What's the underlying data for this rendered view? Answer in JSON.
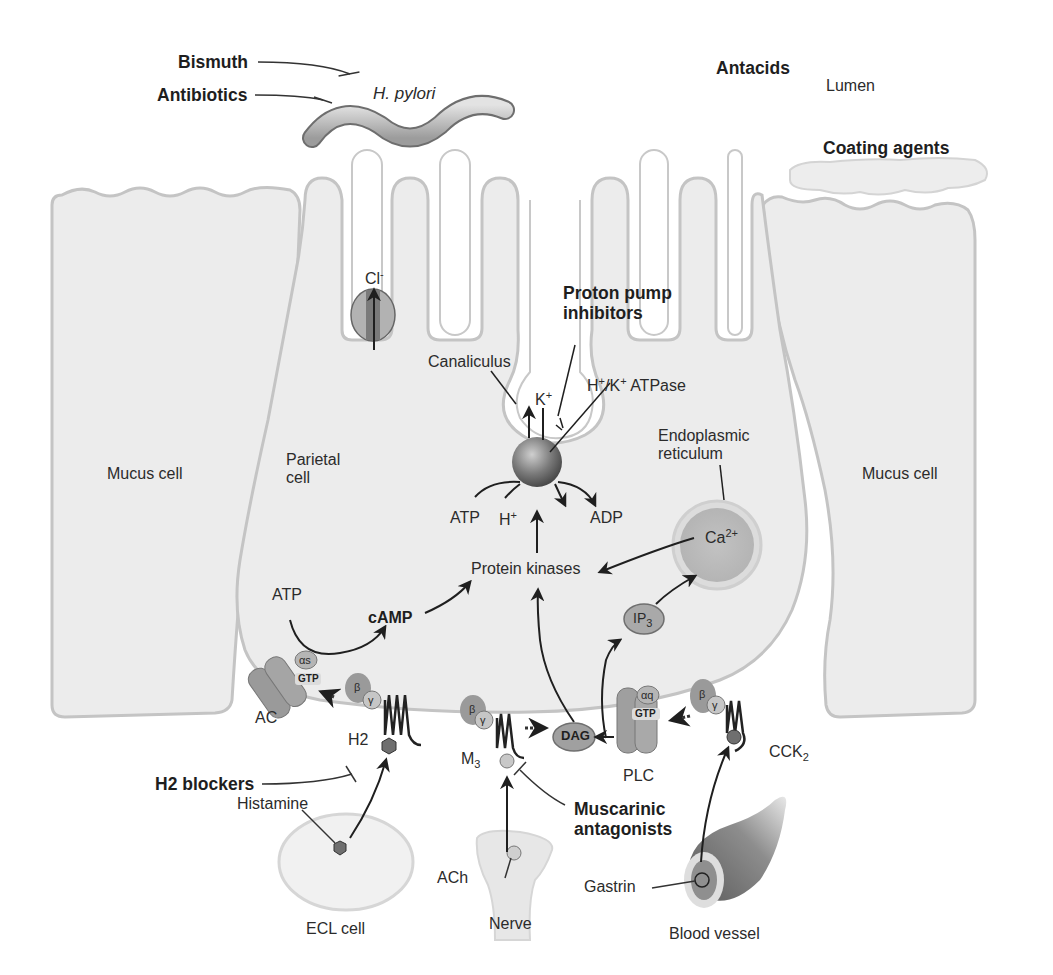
{
  "figure": {
    "lumen_label": "Lumen",
    "drugs": {
      "bismuth": "Bismuth",
      "antibiotics": "Antibiotics",
      "antacids": "Antacids",
      "coating_agents": "Coating agents",
      "proton_pump_inhibitors_line1": "Proton pump",
      "proton_pump_inhibitors_line2": "inhibitors",
      "h2_blockers": "H2 blockers",
      "muscarinic_antagonists_line1": "Muscarinic",
      "muscarinic_antagonists_line2": "antagonists"
    },
    "organisms": {
      "h_pylori": "H. pylori"
    },
    "cells": {
      "mucus_cell_left": "Mucus cell",
      "mucus_cell_right": "Mucus cell",
      "parietal_cell_line1": "Parietal",
      "parietal_cell_line2": "cell",
      "ecl_cell": "ECL cell",
      "nerve": "Nerve",
      "blood_vessel": "Blood vessel"
    },
    "structures": {
      "canaliculus": "Canaliculus",
      "atpase_base": "ATPase",
      "atpase_h": "H",
      "atpase_k": "/K",
      "endoplasmic_line1": "Endoplasmic",
      "endoplasmic_line2": "reticulum"
    },
    "ions": {
      "cl": "Cl",
      "cl_charge": "-",
      "k": "K",
      "k_charge": "+",
      "h": "H",
      "h_charge": "+",
      "ca": "Ca",
      "ca_charge": "2+"
    },
    "molecules": {
      "atp_pump": "ATP",
      "adp": "ADP",
      "protein_kinases": "Protein kinases",
      "atp_ac": "ATP",
      "camp": "cAMP",
      "ip3": "IP",
      "ip3_sub": "3",
      "dag": "DAG",
      "histamine": "Histamine",
      "ach": "ACh",
      "gastrin": "Gastrin"
    },
    "receptors": {
      "ac": "AC",
      "h2": "H2",
      "m3": "M",
      "m3_sub": "3",
      "plc": "PLC",
      "cck": "CCK",
      "cck_sub": "2"
    },
    "g_protein": {
      "alpha_s": "αs",
      "alpha_q": "αq",
      "gtp": "GTP",
      "beta": "β",
      "gamma": "γ"
    },
    "colors": {
      "cell_fill": "#ebebeb",
      "membrane": "#bdbdbd",
      "protein_dark": "#8e8e8e",
      "protein_mid": "#a9a9a9",
      "line": "#1f1f1f"
    }
  }
}
